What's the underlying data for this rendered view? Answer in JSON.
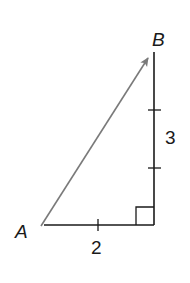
{
  "diagram": {
    "type": "right-triangle-vector",
    "points": {
      "A": {
        "label": "A"
      },
      "B": {
        "label": "B"
      }
    },
    "legs": {
      "horizontal": {
        "length_label": "2"
      },
      "vertical": {
        "length_label": "3"
      }
    },
    "vector": {
      "from": "A",
      "to": "B"
    },
    "right_angle_marker": true,
    "colors": {
      "vector": "#7a7a7a",
      "legs": "#1a1a1a",
      "background": "#ffffff"
    }
  }
}
